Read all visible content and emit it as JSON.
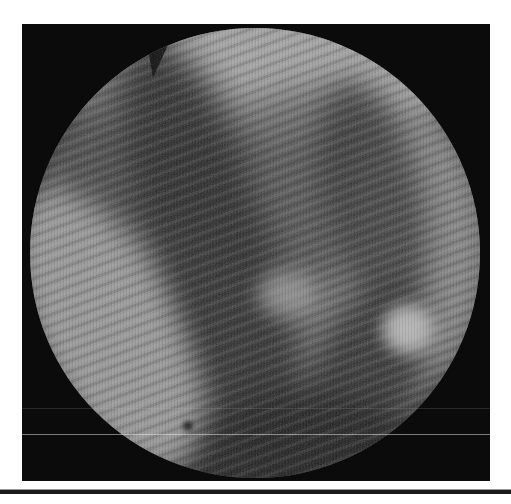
{
  "meta": {
    "text_content": ""
  },
  "colors": {
    "page-bg": "#ffffff",
    "frame-bg": "#0b0b0b",
    "rule-dark": "#1a1a1a",
    "rule-light": "#9a9a9a",
    "photo-base": "#6e6e6e"
  },
  "geometry": {
    "page": {
      "x": 0,
      "y": 0,
      "w": 511,
      "h": 504,
      "color": "#ffffff"
    },
    "frame": {
      "x": 22,
      "y": 24,
      "w": 468,
      "h": 457,
      "color": "#0b0b0b"
    },
    "circle": {
      "x": 8,
      "y": 4,
      "w": 450,
      "h": 450
    },
    "layers": {
      "top_highlight": {
        "x": -20,
        "y": -58,
        "w": 490,
        "h": 172,
        "color": "#a6a6a6",
        "blur": 12,
        "opacity": 0.95
      },
      "dark_top_left": {
        "x": 8,
        "y": 38,
        "w": 200,
        "h": 170,
        "color": "#3c3c3c",
        "rotate": -20,
        "blur": 18,
        "opacity": 0.7
      },
      "dark_mid_top": {
        "x": 150,
        "y": 62,
        "w": 250,
        "h": 190,
        "color": "#454545",
        "rotate": -10,
        "blur": 18,
        "opacity": 0.65
      },
      "right_light": {
        "x": 320,
        "y": 78,
        "w": 150,
        "h": 270,
        "color": "#8e8e8e",
        "rotate": -6,
        "blur": 18,
        "opacity": 0.7
      },
      "dark_fold_right_upper": {
        "x": 295,
        "y": 50,
        "w": 95,
        "h": 245,
        "color": "#303030",
        "rotate": -13,
        "blur": 14,
        "opacity": 0.75
      },
      "dark_fold_left": {
        "x": 125,
        "y": -5,
        "w": 120,
        "h": 475,
        "color": "#262626",
        "rotate": -18,
        "blur": 16,
        "opacity": 0.85
      },
      "dark_fold_right_lower": {
        "x": 278,
        "y": 250,
        "w": 105,
        "h": 215,
        "color": "#2c2c2c",
        "rotate": 22,
        "blur": 14,
        "opacity": 0.85
      },
      "dark_bottom": {
        "x": 115,
        "y": 368,
        "w": 265,
        "h": 135,
        "color": "#1f1f1f",
        "rotate": -10,
        "blur": 14,
        "opacity": 0.9
      },
      "left_crescent": {
        "x": 10,
        "y": 150,
        "w": 135,
        "h": 310,
        "color": "#9c9c9c",
        "rotate": -26,
        "blur": 14,
        "opacity": 0.9
      },
      "highlight_center": {
        "x": 227,
        "y": 243,
        "w": 58,
        "h": 46,
        "color": "#a2a2a2",
        "blur": 10,
        "opacity": 0.75
      },
      "highlight_right": {
        "x": 352,
        "y": 276,
        "w": 52,
        "h": 50,
        "color": "#bdbdbd",
        "blur": 8,
        "opacity": 0.95
      },
      "debris_dot": {
        "x": 153,
        "y": 393,
        "w": 10,
        "h": 10,
        "color": "#141414",
        "blur": 2,
        "opacity": 0.9
      },
      "notch": {
        "x": 110,
        "y": 0,
        "w": 34,
        "h": 50,
        "color": "#0b0b0b",
        "rotate": 3
      }
    },
    "scan_line_main": {
      "x": 0,
      "y": 410,
      "w": 468,
      "h": 1,
      "color": "rgba(235,235,235,0.5)"
    },
    "scan_line_faint": {
      "x": 0,
      "y": 384,
      "w": 468,
      "h": 1,
      "color": "rgba(200,200,200,0.15)"
    },
    "rule": {
      "x": 0,
      "y": 489,
      "w": 511,
      "h": 5
    }
  }
}
